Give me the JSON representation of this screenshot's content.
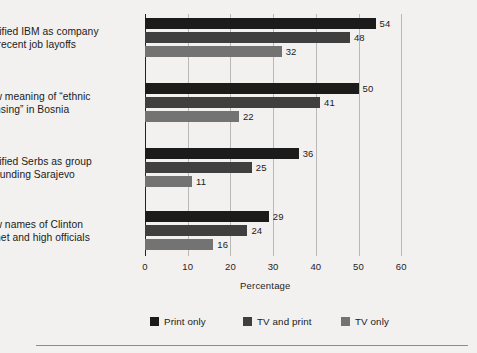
{
  "chart_data": {
    "type": "bar",
    "orientation": "horizontal",
    "title": "",
    "xlabel": "Percentage",
    "ylabel": "",
    "xlim": [
      0,
      60
    ],
    "xticks": [
      0,
      10,
      20,
      30,
      40,
      50,
      60
    ],
    "grid": true,
    "legend_position": "bottom",
    "categories": [
      "Identified IBM as company with recent job layoffs",
      "Know meaning of “ethnic cleansing” in Bosnia",
      "Identified Serbs as group surrounding Sarajevo",
      "Know names of Clinton cabinet and high officials"
    ],
    "series": [
      {
        "name": "Print only",
        "color": "#1b1b1b",
        "values": [
          54,
          50,
          36,
          29
        ]
      },
      {
        "name": "TV and print",
        "color": "#3f3f3f",
        "values": [
          48,
          41,
          25,
          24
        ]
      },
      {
        "name": "TV only",
        "color": "#737373",
        "values": [
          32,
          22,
          11,
          16
        ]
      }
    ]
  },
  "categories": [
    {
      "line1": "Identified IBM as company",
      "line2": "with recent job layoffs"
    },
    {
      "line1": "Know meaning of “ethnic",
      "line2": "cleansing” in Bosnia"
    },
    {
      "line1": "Identified Serbs as group",
      "line2": "surrounding Sarajevo"
    },
    {
      "line1": "Know names of Clinton",
      "line2": "cabinet and high officials"
    }
  ],
  "bars": [
    {
      "value": 54,
      "label": "54"
    },
    {
      "value": 48,
      "label": "48"
    },
    {
      "value": 32,
      "label": "32"
    },
    {
      "value": 50,
      "label": "50"
    },
    {
      "value": 41,
      "label": "41"
    },
    {
      "value": 22,
      "label": "22"
    },
    {
      "value": 36,
      "label": "36"
    },
    {
      "value": 25,
      "label": "25"
    },
    {
      "value": 11,
      "label": "11"
    },
    {
      "value": 29,
      "label": "29"
    },
    {
      "value": 24,
      "label": "24"
    },
    {
      "value": 16,
      "label": "16"
    }
  ],
  "axis": {
    "title": "Percentage",
    "ticks": [
      "0",
      "10",
      "20",
      "30",
      "40",
      "50",
      "60"
    ]
  },
  "legend": {
    "items": [
      {
        "label": "Print only",
        "color": "#1b1b1b"
      },
      {
        "label": "TV and print",
        "color": "#3f3f3f"
      },
      {
        "label": "TV only",
        "color": "#737373"
      }
    ]
  }
}
